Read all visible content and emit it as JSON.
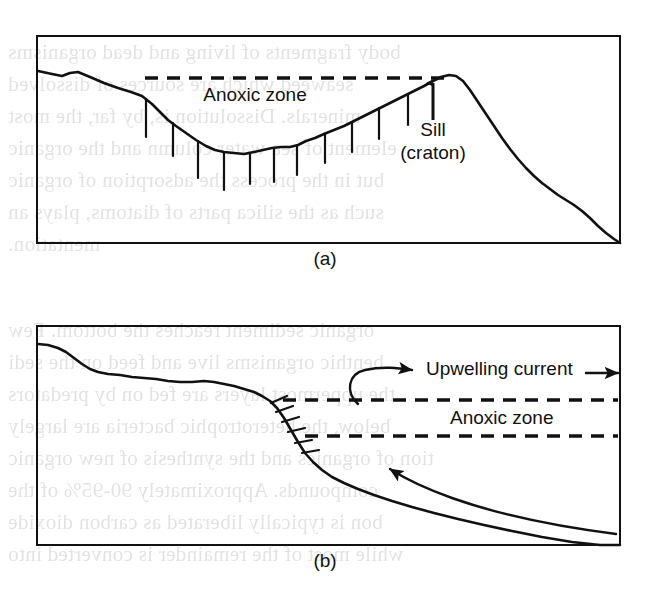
{
  "figure": {
    "panels": [
      {
        "id": "panel-a",
        "caption": "(a)",
        "frame": {
          "x": 37,
          "y": 36,
          "w": 583,
          "h": 207
        },
        "labels": [
          {
            "name": "anoxic-zone-label-a",
            "text": "Anoxic zone",
            "x": 255,
            "y": 101,
            "size": 19,
            "anchor": "middle"
          },
          {
            "name": "sill-label-line1",
            "text": "Sill",
            "x": 433,
            "y": 136,
            "size": 19,
            "anchor": "middle"
          },
          {
            "name": "sill-label-line2",
            "text": "(craton)",
            "x": 433,
            "y": 159,
            "size": 19,
            "anchor": "middle"
          }
        ],
        "seafloor": "M 38,71 L 52,74 L 62,76 L 70,73 L 78,72 L 90,77 L 104,83 L 118,88 L 131,92 L 142,96 L 152,104 L 160,112 L 168,120 L 176,126 L 186,133 L 196,140 L 206,146 L 215,150 L 224,152 L 234,153 L 244,154 L 254,152 L 263,150 L 272,148 L 281,147 L 290,147 L 298,145 L 306,141 L 315,138 L 324,134 L 334,130 L 344,126 L 354,121 L 364,116 L 374,111 L 384,106 L 394,101 L 404,96 L 414,91 L 424,86 L 433,81 L 441,77 L 449,75 L 456,76 L 463,81 L 470,90 L 478,102 L 486,114 L 494,126 L 502,138 L 510,149 L 518,159 L 526,168 L 534,176 L 542,183 L 550,189 L 558,195 L 566,200 L 574,205 L 582,211 L 590,218 L 598,226 L 606,233 L 614,239 L 620,243",
        "hatch_ticks": [
          {
            "x1": 146,
            "y1": 99,
            "x2": 146,
            "y2": 137
          },
          {
            "x1": 173,
            "y1": 123,
            "x2": 173,
            "y2": 156
          },
          {
            "x1": 198,
            "y1": 141,
            "x2": 198,
            "y2": 178
          },
          {
            "x1": 224,
            "y1": 152,
            "x2": 224,
            "y2": 190
          },
          {
            "x1": 250,
            "y1": 153,
            "x2": 250,
            "y2": 184
          },
          {
            "x1": 274,
            "y1": 148,
            "x2": 274,
            "y2": 182
          },
          {
            "x1": 297,
            "y1": 145,
            "x2": 297,
            "y2": 175
          },
          {
            "x1": 325,
            "y1": 134,
            "x2": 325,
            "y2": 163
          },
          {
            "x1": 352,
            "y1": 122,
            "x2": 352,
            "y2": 152
          },
          {
            "x1": 379,
            "y1": 108,
            "x2": 379,
            "y2": 139
          },
          {
            "x1": 408,
            "y1": 94,
            "x2": 408,
            "y2": 125
          }
        ],
        "dashed_lines": [
          {
            "name": "anoxic-upper-boundary-a",
            "x1": 145,
            "y1": 78,
            "x2": 452,
            "y2": 78
          }
        ],
        "arrows": [
          {
            "name": "sill-pointer-arrow",
            "x1": 433,
            "y1": 120,
            "x2": 433,
            "y2": 83
          }
        ]
      },
      {
        "id": "panel-b",
        "caption": "(b)",
        "frame": {
          "x": 37,
          "y": 326,
          "w": 583,
          "h": 219
        },
        "labels": [
          {
            "name": "upwelling-current-label",
            "text": "Upwelling current",
            "x": 426,
            "y": 375,
            "size": 19,
            "anchor": "start"
          },
          {
            "name": "anoxic-zone-label-b",
            "text": "Anoxic zone",
            "x": 450,
            "y": 424,
            "size": 19,
            "anchor": "start"
          }
        ],
        "seafloor": "M 38,344 L 48,345 L 58,348 L 66,352 L 74,358 L 82,364 L 90,369 L 98,372 L 108,374 L 120,375 L 132,377 L 144,378 L 156,379 L 168,381 L 180,382 L 192,382 L 204,381 L 214,382 L 224,384 L 234,386 L 244,389 L 254,392 L 262,396 L 270,401 L 277,408 L 284,418 L 291,430 L 298,442 L 305,453 L 313,462 L 322,470 L 332,477 L 344,483 L 358,489 L 374,495 L 392,501 L 412,507 L 434,513 L 458,519 L 484,525 L 512,531 L 542,537 L 572,542 L 600,545 L 620,545",
        "hatch_ticks": [
          {
            "x1": 271,
            "y1": 403,
            "x2": 287,
            "y2": 396
          },
          {
            "x1": 276,
            "y1": 412,
            "x2": 293,
            "y2": 406
          },
          {
            "x1": 282,
            "y1": 422,
            "x2": 299,
            "y2": 417
          },
          {
            "x1": 288,
            "y1": 432,
            "x2": 305,
            "y2": 428
          },
          {
            "x1": 295,
            "y1": 443,
            "x2": 312,
            "y2": 440
          },
          {
            "x1": 302,
            "y1": 453,
            "x2": 319,
            "y2": 450
          }
        ],
        "dashed_lines": [
          {
            "name": "anoxic-upper-boundary-b",
            "x1": 283,
            "y1": 400,
            "x2": 618,
            "y2": 400
          },
          {
            "name": "anoxic-lower-boundary-b",
            "x1": 305,
            "y1": 436,
            "x2": 618,
            "y2": 436
          }
        ],
        "hook_arrow": {
          "name": "upwelling-hook-arrow",
          "path": "M 358,404 C 345,392 348,374 365,370 C 383,366 398,368 412,370"
        },
        "straight_arrow": {
          "name": "upwelling-current-straight-arrow",
          "x1": 586,
          "y1": 373,
          "x2": 618,
          "y2": 373
        },
        "deep_arrow": {
          "name": "deep-water-inflow-arrow",
          "path": "M 616,534 C 560,527 500,515 452,498 C 424,488 404,478 390,469"
        }
      }
    ],
    "captions": [
      {
        "name": "panel-a-caption",
        "text": "(a)",
        "x": 325,
        "y": 262
      },
      {
        "name": "panel-b-caption",
        "text": "(b)",
        "x": 325,
        "y": 564
      }
    ],
    "style": {
      "stroke_color": "#111111",
      "background": "#ffffff",
      "frame_stroke_width": 2,
      "profile_stroke_width": 2.6,
      "dash_pattern": "13,9"
    }
  },
  "bleed_through_text": {
    "note": "faint mirrored show-through text from reverse page of scan",
    "lines": [
      {
        "text": "body fragments of living and dead organisms",
        "x": 8,
        "y": 40
      },
      {
        "text": "seaweed which are sources of dissolved",
        "x": 8,
        "y": 72
      },
      {
        "text": "minerals. Dissolution is, by far, the most",
        "x": 8,
        "y": 104
      },
      {
        "text": "element of sea water column and the organic",
        "x": 8,
        "y": 136
      },
      {
        "text": "but in the process the adsorption of organic",
        "x": 8,
        "y": 168
      },
      {
        "text": "such as the silica parts of diatoms, plays an",
        "x": 8,
        "y": 200
      },
      {
        "text": "mentation.",
        "x": 8,
        "y": 232
      },
      {
        "text": "organic sediment reaches the bottom. Few",
        "x": 8,
        "y": 318
      },
      {
        "text": "benthic organisms live and feed on the sedi",
        "x": 8,
        "y": 350
      },
      {
        "text": "the uppermost layers are fed on by predators",
        "x": 8,
        "y": 382
      },
      {
        "text": "below, the heterotrophic bacteria are largely",
        "x": 8,
        "y": 414
      },
      {
        "text": "tion of organics and the synthesis of new organic",
        "x": 8,
        "y": 446
      },
      {
        "text": "compounds. Approximately 90-95% of the",
        "x": 8,
        "y": 478
      },
      {
        "text": "bon is typically liberated as carbon dioxide",
        "x": 8,
        "y": 510
      },
      {
        "text": "while most of the remainder is converted into",
        "x": 8,
        "y": 542
      }
    ]
  }
}
